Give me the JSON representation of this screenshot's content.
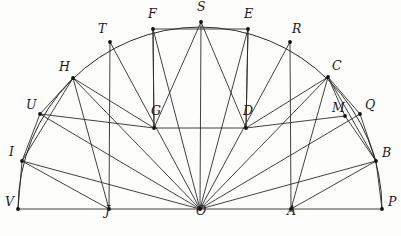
{
  "figure": {
    "type": "geometric-diagram",
    "canvas": {
      "width": 401,
      "height": 236
    },
    "stroke_color": "#2b2b2b",
    "point_color": "#111111",
    "background_color": "#fdfdfc",
    "center": {
      "name": "O",
      "x": 200,
      "y": 209
    },
    "radius": 182,
    "baseline": {
      "from": "V",
      "to": "P",
      "y": 209
    },
    "arc": {
      "from": "V",
      "to": "P",
      "direction": "upper",
      "sweep_degrees": 180
    },
    "points": [
      {
        "name": "V",
        "x": 18,
        "y": 209,
        "on": "arc-end",
        "label_dx": -13,
        "label_dy": -4
      },
      {
        "name": "I",
        "x": 22,
        "y": 161,
        "on": "arc",
        "label_dx": -13,
        "label_dy": -6
      },
      {
        "name": "U",
        "x": 40,
        "y": 114,
        "on": "arc",
        "label_dx": -14,
        "label_dy": -6
      },
      {
        "name": "H",
        "x": 73,
        "y": 78,
        "on": "arc",
        "label_dx": -14,
        "label_dy": -8
      },
      {
        "name": "T",
        "x": 110,
        "y": 42,
        "on": "arc",
        "label_dx": -12,
        "label_dy": -10
      },
      {
        "name": "F",
        "x": 153,
        "y": 29,
        "on": "arc",
        "label_dx": -5,
        "label_dy": -12
      },
      {
        "name": "S",
        "x": 201,
        "y": 22,
        "on": "arc-apex",
        "label_dx": -4,
        "label_dy": -12
      },
      {
        "name": "E",
        "x": 248,
        "y": 29,
        "on": "arc",
        "label_dx": -4,
        "label_dy": -12
      },
      {
        "name": "R",
        "x": 290,
        "y": 42,
        "on": "arc",
        "label_dx": 2,
        "label_dy": -10
      },
      {
        "name": "C",
        "x": 328,
        "y": 77,
        "on": "arc",
        "label_dx": 4,
        "label_dy": -8
      },
      {
        "name": "Q",
        "x": 360,
        "y": 114,
        "on": "arc",
        "label_dx": 5,
        "label_dy": -6
      },
      {
        "name": "B",
        "x": 376,
        "y": 161,
        "on": "arc",
        "label_dx": 6,
        "label_dy": -5
      },
      {
        "name": "P",
        "x": 382,
        "y": 209,
        "on": "arc-end",
        "label_dx": 6,
        "label_dy": -4
      },
      {
        "name": "J",
        "x": 109,
        "y": 209,
        "on": "baseline",
        "label_dx": -4,
        "label_dy": 5
      },
      {
        "name": "O",
        "x": 200,
        "y": 209,
        "on": "center",
        "label_dx": -4,
        "label_dy": 5
      },
      {
        "name": "A",
        "x": 291,
        "y": 209,
        "on": "baseline",
        "label_dx": -4,
        "label_dy": 5
      },
      {
        "name": "G",
        "x": 154,
        "y": 128,
        "on": "interior",
        "label_dx": -3,
        "label_dy": -14
      },
      {
        "name": "D",
        "x": 246,
        "y": 128,
        "on": "interior",
        "label_dx": -3,
        "label_dy": -14
      },
      {
        "name": "M",
        "x": 345,
        "y": 116,
        "on": "interior",
        "label_dx": -13,
        "label_dy": -5
      }
    ],
    "segments": [
      {
        "name": "baseline-VP",
        "from": "V",
        "to": "P"
      },
      {
        "name": "radius-OI",
        "from": "O",
        "to": "I"
      },
      {
        "name": "radius-OU",
        "from": "O",
        "to": "U"
      },
      {
        "name": "radius-OH",
        "from": "O",
        "to": "H"
      },
      {
        "name": "radius-OT",
        "from": "O",
        "to": "T"
      },
      {
        "name": "radius-OF",
        "from": "O",
        "to": "F"
      },
      {
        "name": "radius-OS",
        "from": "O",
        "to": "S"
      },
      {
        "name": "radius-OE",
        "from": "O",
        "to": "E"
      },
      {
        "name": "radius-OR",
        "from": "O",
        "to": "R"
      },
      {
        "name": "radius-OC",
        "from": "O",
        "to": "C"
      },
      {
        "name": "radius-OQ",
        "from": "O",
        "to": "Q"
      },
      {
        "name": "radius-OB",
        "from": "O",
        "to": "B"
      },
      {
        "name": "chord-FG",
        "from": "F",
        "to": "G"
      },
      {
        "name": "chord-GS",
        "from": "G",
        "to": "S"
      },
      {
        "name": "chord-SD",
        "from": "S",
        "to": "D"
      },
      {
        "name": "chord-DE",
        "from": "D",
        "to": "E"
      },
      {
        "name": "rect-top-FE",
        "from": "F",
        "to": "E"
      },
      {
        "name": "rect-left-FG",
        "from": "F",
        "to": "G"
      },
      {
        "name": "rect-right-ED",
        "from": "E",
        "to": "D"
      },
      {
        "name": "rect-bottom-GD",
        "from": "G",
        "to": "D"
      },
      {
        "name": "chord-HG",
        "from": "H",
        "to": "G"
      },
      {
        "name": "chord-HJ",
        "from": "H",
        "to": "J"
      },
      {
        "name": "chord-HU",
        "from": "H",
        "to": "U"
      },
      {
        "name": "chord-HI",
        "from": "H",
        "to": "I"
      },
      {
        "name": "chord-UI",
        "from": "U",
        "to": "I"
      },
      {
        "name": "chord-IJ",
        "from": "I",
        "to": "J"
      },
      {
        "name": "chord-IV",
        "from": "I",
        "to": "V"
      },
      {
        "name": "chord-TJ",
        "from": "T",
        "to": "J"
      },
      {
        "name": "chord-UG",
        "from": "U",
        "to": "G"
      },
      {
        "name": "chord-CD",
        "from": "C",
        "to": "D"
      },
      {
        "name": "chord-CA",
        "from": "C",
        "to": "A"
      },
      {
        "name": "chord-CM",
        "from": "C",
        "to": "M"
      },
      {
        "name": "chord-CQ",
        "from": "C",
        "to": "Q"
      },
      {
        "name": "chord-CB",
        "from": "C",
        "to": "B"
      },
      {
        "name": "chord-MB",
        "from": "M",
        "to": "B"
      },
      {
        "name": "chord-QB",
        "from": "Q",
        "to": "B"
      },
      {
        "name": "chord-BA",
        "from": "B",
        "to": "A"
      },
      {
        "name": "chord-BP",
        "from": "B",
        "to": "P"
      },
      {
        "name": "chord-RA",
        "from": "R",
        "to": "A"
      },
      {
        "name": "chord-MD",
        "from": "M",
        "to": "D"
      }
    ]
  }
}
